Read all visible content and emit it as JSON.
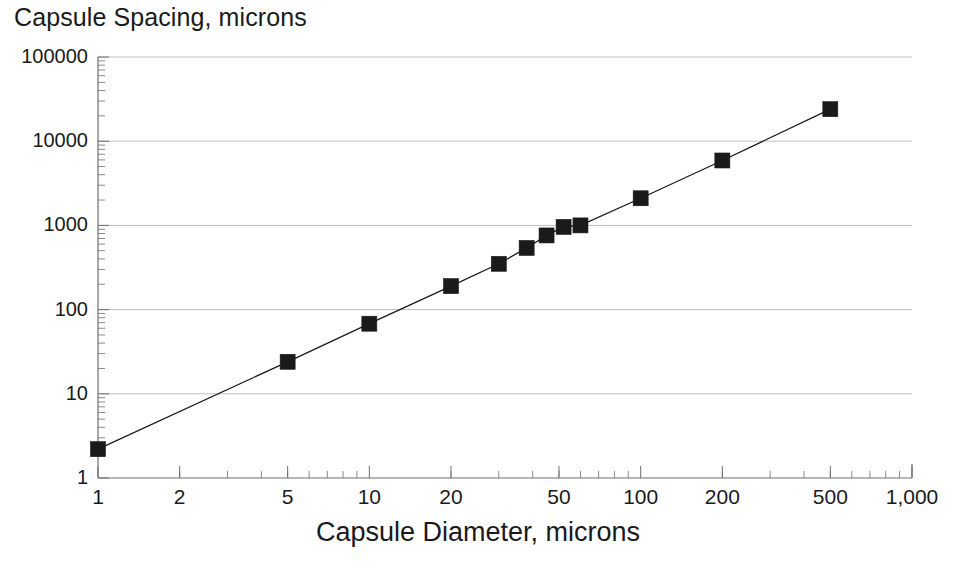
{
  "chart_data": {
    "type": "line",
    "title": "Capsule Spacing, microns",
    "xlabel": "Capsule Diameter, microns",
    "ylabel": "Capsule Spacing, microns",
    "xscale": "log",
    "yscale": "log",
    "xlim": [
      1,
      1000
    ],
    "ylim": [
      1,
      100000
    ],
    "grid": "horizontal-only",
    "legend": "none",
    "marker": "filled-square",
    "line_color": "#1a1a1a",
    "marker_color": "#1a1a1a",
    "background_color": "#ffffff",
    "gridline_color": "#bfbfbf",
    "axis_color": "#8a8a8a",
    "x_tick_labels": [
      "1",
      "2",
      "5",
      "10",
      "20",
      "50",
      "100",
      "200",
      "500",
      "1,000"
    ],
    "x_tick_values": [
      1,
      2,
      5,
      10,
      20,
      50,
      100,
      200,
      500,
      1000
    ],
    "y_tick_labels": [
      "1",
      "10",
      "100",
      "1000",
      "10000",
      "100000"
    ],
    "y_tick_values": [
      1,
      10,
      100,
      1000,
      10000,
      100000
    ],
    "x": [
      1,
      5,
      10,
      20,
      30,
      38,
      45,
      52,
      60,
      100,
      200,
      500
    ],
    "y": [
      2.2,
      24,
      68,
      190,
      350,
      540,
      760,
      960,
      1000,
      2100,
      5900,
      24000
    ],
    "points": [
      {
        "x": 1,
        "y": 2.2
      },
      {
        "x": 5,
        "y": 24
      },
      {
        "x": 10,
        "y": 68
      },
      {
        "x": 20,
        "y": 190
      },
      {
        "x": 30,
        "y": 350
      },
      {
        "x": 38,
        "y": 540
      },
      {
        "x": 45,
        "y": 760
      },
      {
        "x": 52,
        "y": 960
      },
      {
        "x": 60,
        "y": 1000
      },
      {
        "x": 100,
        "y": 2100
      },
      {
        "x": 200,
        "y": 5900
      },
      {
        "x": 500,
        "y": 24000
      }
    ]
  },
  "plot_geometry": {
    "left": 98,
    "right": 912,
    "top": 57,
    "bottom": 478
  }
}
